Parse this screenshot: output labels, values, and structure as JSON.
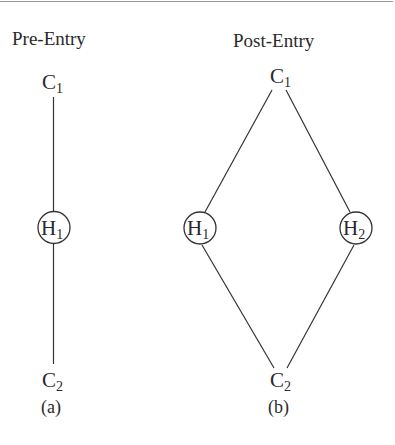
{
  "figure": {
    "panel_a": {
      "title": "Pre-Entry",
      "caption": "(a)",
      "nodes": {
        "top": {
          "base": "C",
          "sub": "1"
        },
        "middle": {
          "base": "H",
          "sub": "1"
        },
        "bottom": {
          "base": "C",
          "sub": "2"
        }
      },
      "edges": [
        [
          "C1",
          "H1"
        ],
        [
          "H1",
          "C2"
        ]
      ]
    },
    "panel_b": {
      "title": "Post-Entry",
      "caption": "(b)",
      "nodes": {
        "top": {
          "base": "C",
          "sub": "1"
        },
        "left": {
          "base": "H",
          "sub": "1"
        },
        "right": {
          "base": "H",
          "sub": "2"
        },
        "bottom": {
          "base": "C",
          "sub": "2"
        }
      },
      "edges": [
        [
          "C1",
          "H1"
        ],
        [
          "C1",
          "H2"
        ],
        [
          "H1",
          "C2"
        ],
        [
          "H2",
          "C2"
        ]
      ]
    }
  },
  "colors": {
    "line": "#333333",
    "text": "#2a2a2a",
    "rule": "#9a9a9a",
    "background": "#ffffff"
  }
}
